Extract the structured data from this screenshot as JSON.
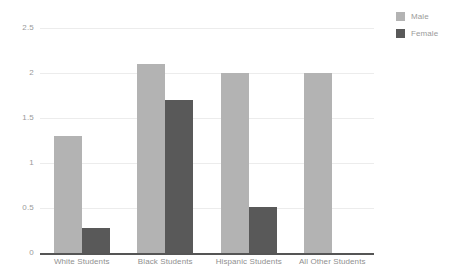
{
  "chart_data": {
    "type": "bar",
    "title": "",
    "subtitle": "",
    "xlabel": "",
    "ylabel": "",
    "categories": [
      "White Students",
      "Black Students",
      "Hispanic Students",
      "All Other Students"
    ],
    "series": [
      {
        "name": "Male",
        "color": "#b3b3b3",
        "values": [
          1.3,
          2.1,
          2.0,
          2.0
        ]
      },
      {
        "name": "Female",
        "color": "#595959",
        "values": [
          0.28,
          1.7,
          0.51,
          null
        ]
      }
    ],
    "ylim": [
      0,
      2.5
    ],
    "yticks": [
      0,
      0.5,
      1,
      1.5,
      2,
      2.5
    ],
    "ytick_labels": [
      "0",
      "0.5",
      "1",
      "1.5",
      "2",
      "2.5"
    ],
    "grid": true,
    "grid_axis": "y",
    "legend_position": "top-right",
    "grouped": true,
    "annotations": []
  },
  "legend": {
    "items": [
      {
        "label": "Male",
        "color": "#b3b3b3"
      },
      {
        "label": "Female",
        "color": "#595959"
      }
    ]
  },
  "colors": {
    "male": "#b3b3b3",
    "female": "#595959",
    "gridline": "#ececec",
    "baseline": "#555555",
    "tick_text": "#9a9a9a",
    "category_text": "#8f8f8f",
    "background": "#ffffff"
  }
}
